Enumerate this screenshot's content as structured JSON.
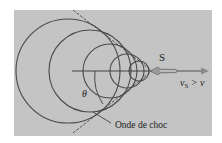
{
  "figure": {
    "colors": {
      "page_bg": "#ffffff",
      "panel_bg": "#c4c4c4",
      "circle_stroke": "#4a4a4a",
      "tangent_stroke": "#3a3a3a",
      "arrow": "#8a8a8a",
      "text": "#222222"
    },
    "panel": {
      "x": 14,
      "y": 10,
      "w": 198,
      "h": 126
    },
    "axis": {
      "x1": 72,
      "y1": 71,
      "x2": 152,
      "y2": 71
    },
    "apex": {
      "x": 152,
      "y": 71
    },
    "wavefronts": [
      {
        "cx": 68,
        "cy": 71,
        "r": 52
      },
      {
        "cx": 90,
        "cy": 71,
        "r": 41
      },
      {
        "cx": 110,
        "cy": 71,
        "r": 27
      },
      {
        "cx": 127,
        "cy": 71,
        "r": 17
      },
      {
        "cx": 139,
        "cy": 71,
        "r": 10
      }
    ],
    "tangents": [
      {
        "x1": 73,
        "y1": 10,
        "x2": 152,
        "y2": 71
      },
      {
        "x1": 73,
        "y1": 133,
        "x2": 152,
        "y2": 71
      }
    ],
    "source_label": "S",
    "velocity_label_v": "v",
    "velocity_label_sub": "S",
    "velocity_label_rest": " > v",
    "angle_label": "θ",
    "shock_label": "Onde de choc",
    "leader": {
      "x1": 93,
      "y1": 112,
      "x2": 111,
      "y2": 123
    }
  }
}
